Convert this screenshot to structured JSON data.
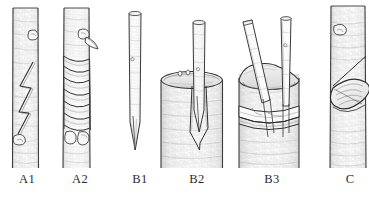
{
  "plate": {
    "title": "Grafting and budding techniques",
    "background_color": "#ffffff",
    "ink_color": "#3a3a3a",
    "shade_color": "#9a9a9a",
    "width": 369,
    "height": 199,
    "style": "pen-and-ink line drawing",
    "figures": [
      {
        "id": "A1",
        "label": "A1",
        "label_x": 27,
        "name": "stem-with-zigzag-bark-incision",
        "description": "Upright woody stem with a long zigzag (lightning-shaped) bark incision and two lateral buds",
        "stem_left": 12,
        "stem_right": 39,
        "stem_top": 8,
        "stem_bottom": 168,
        "buds": 2
      },
      {
        "id": "A2",
        "label": "A2",
        "label_x": 80,
        "name": "stem-with-spiral-binding-wrap",
        "description": "Same stem bound with a spiral wrapping tape over the graft union, bud and leaf stub visible",
        "stem_left": 63,
        "stem_right": 90,
        "stem_top": 8,
        "stem_bottom": 168,
        "wrap_turns": 6
      },
      {
        "id": "B1",
        "label": "B1",
        "label_x": 140,
        "name": "scion-stick-with-wedge-cut",
        "description": "Slender scion stick cut to a long tapered wedge at its lower end",
        "stem_left": 128,
        "stem_right": 141,
        "stem_top": 12,
        "stem_bottom": 150
      },
      {
        "id": "B2",
        "label": "B2",
        "label_x": 197,
        "name": "single-scion-inserted-in-cleft-stock",
        "description": "One wedge-cut scion inserted into the split bark of a sawn-off rootstock",
        "stock_left": 160,
        "stock_right": 223,
        "stock_top": 72,
        "stock_bottom": 168,
        "scions": 1
      },
      {
        "id": "B3",
        "label": "B3",
        "label_x": 272,
        "name": "two-scions-inserted-in-bound-stock",
        "description": "Two wedge-cut scions set into a sawn-off rootstock whose union is bound with tape",
        "stock_left": 238,
        "stock_right": 300,
        "stock_top": 66,
        "stock_bottom": 168,
        "scions": 2
      },
      {
        "id": "C",
        "label": "C",
        "label_x": 350,
        "name": "stem-with-shield-bud-patch",
        "description": "Stem bearing a lens-shaped shield bud patch set into a sloping cut, with a bud above",
        "stem_left": 330,
        "stem_right": 366,
        "stem_top": 6,
        "stem_bottom": 168
      }
    ]
  }
}
